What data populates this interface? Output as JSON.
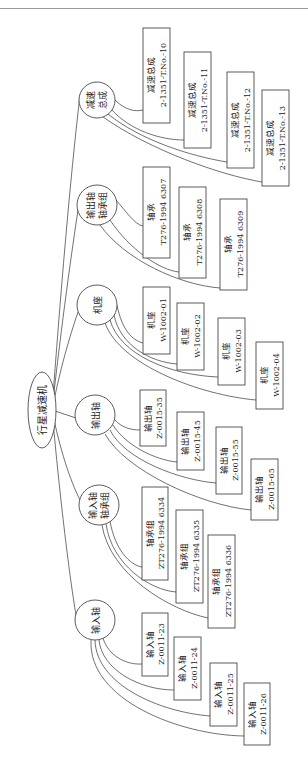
{
  "page_header": {
    "text": ""
  },
  "diagram": {
    "type": "tree",
    "orientation": "rotated-90-ccw",
    "root": {
      "label": "行星减速机",
      "shape": "ellipse"
    },
    "groups": [
      {
        "label_lines": [
          "减速",
          "总成"
        ],
        "children": [
          {
            "name": "减速总成",
            "code": "2-1351-T.No.-10"
          },
          {
            "name": "减速总成",
            "code": "2-1351-T.No.-11"
          },
          {
            "name": "减速总成",
            "code": "2-1351-T.No.-12"
          },
          {
            "name": "减速总成",
            "code": "2-1351-T.No.-13"
          }
        ]
      },
      {
        "label_lines": [
          "输出轴",
          "轴承组"
        ],
        "children": [
          {
            "name": "轴承",
            "code": "T276-1994 6307"
          },
          {
            "name": "轴承",
            "code": "T276-1994 6308"
          },
          {
            "name": "轴承",
            "code": "T276-1994 6309"
          }
        ]
      },
      {
        "label_lines": [
          "机座"
        ],
        "children": [
          {
            "name": "机座",
            "code": "W-1002-01"
          },
          {
            "name": "机座",
            "code": "W-1002-02"
          },
          {
            "name": "机座",
            "code": "W-1002-03"
          },
          {
            "name": "机座",
            "code": "W-1002-04"
          }
        ]
      },
      {
        "label_lines": [
          "输出轴"
        ],
        "children": [
          {
            "name": "输出轴",
            "code": "Z-0015-35"
          },
          {
            "name": "输出轴",
            "code": "Z-0015-45"
          },
          {
            "name": "输出轴",
            "code": "Z-0015-55"
          },
          {
            "name": "输出轴",
            "code": "Z-0015-65"
          }
        ]
      },
      {
        "label_lines": [
          "输入轴",
          "轴承组"
        ],
        "children": [
          {
            "name": "轴承组",
            "code": "ZT276-1994 6334"
          },
          {
            "name": "轴承组",
            "code": "ZT276-1994 6335"
          },
          {
            "name": "轴承组",
            "code": "ZT276-1994 6336"
          }
        ]
      },
      {
        "label_lines": [
          "输入轴"
        ],
        "children": [
          {
            "name": "输入轴",
            "code": "Z-0011-23"
          },
          {
            "name": "输入轴",
            "code": "Z-0011-24"
          },
          {
            "name": "输入轴",
            "code": "Z-0011-25"
          },
          {
            "name": "输入轴",
            "code": "Z-0011-26"
          }
        ]
      }
    ]
  }
}
